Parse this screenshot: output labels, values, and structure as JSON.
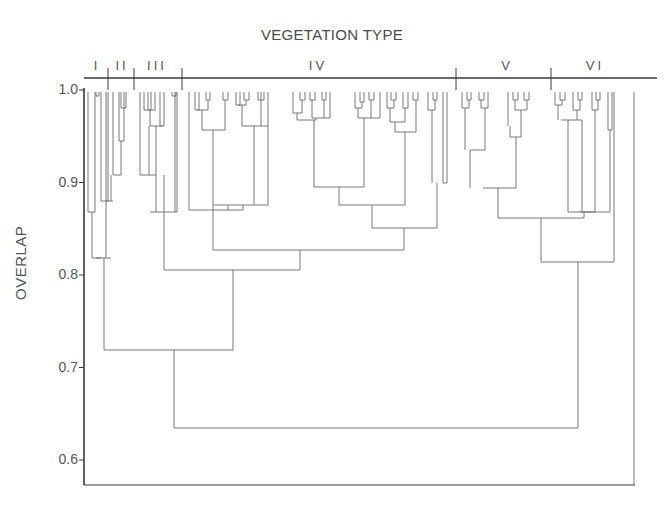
{
  "chart_data": {
    "type": "dendrogram",
    "title": "VEGETATION TYPE",
    "xlabel": "",
    "ylabel": "OVERLAP",
    "ylim": [
      0.55,
      1.0
    ],
    "yticks": [
      "1.0",
      "0.9",
      "0.8",
      "0.7",
      "0.6"
    ],
    "groups": [
      {
        "label": "I",
        "x": 97
      },
      {
        "label": "II",
        "x": 122
      },
      {
        "label": "III",
        "x": 157
      },
      {
        "label": "IV",
        "x": 318
      },
      {
        "label": "V",
        "x": 507
      },
      {
        "label": "VI",
        "x": 595
      }
    ],
    "group_boundaries_x": [
      108,
      134,
      182,
      456,
      551
    ],
    "merges": [
      {
        "groups": "I + II",
        "overlap": 0.8
      },
      {
        "groups": "I+II + III+IV",
        "overlap": 0.8
      },
      {
        "groups": "III + IV",
        "overlap": 0.91
      },
      {
        "groups": "V + VI",
        "overlap": 0.94
      },
      {
        "groups": "(I-IV) + (V-VI)",
        "overlap": 0.655
      }
    ],
    "segments": [
      [
        88,
        92,
        88,
        212
      ],
      [
        95,
        92,
        95,
        212
      ],
      [
        88,
        212,
        95,
        212
      ],
      [
        96,
        92,
        96,
        96
      ],
      [
        99,
        92,
        99,
        96
      ],
      [
        96,
        96,
        99,
        96
      ],
      [
        92,
        212,
        92,
        258
      ],
      [
        101,
        92,
        101,
        201
      ],
      [
        92,
        258,
        101,
        258
      ],
      [
        106,
        92,
        106,
        258
      ],
      [
        101,
        258,
        101,
        258
      ],
      [
        108,
        92,
        108,
        201
      ],
      [
        101,
        201,
        108,
        201
      ],
      [
        113,
        92,
        113,
        175
      ],
      [
        119,
        92,
        119,
        141
      ],
      [
        119,
        141,
        124,
        141
      ],
      [
        124,
        92,
        124,
        141
      ],
      [
        121,
        92,
        121,
        108
      ],
      [
        126,
        92,
        126,
        108
      ],
      [
        121,
        108,
        126,
        108
      ],
      [
        113,
        175,
        121,
        175
      ],
      [
        121,
        141,
        121,
        175
      ],
      [
        106,
        201,
        113,
        201
      ],
      [
        111,
        175,
        111,
        201
      ],
      [
        96,
        258,
        111,
        258
      ],
      [
        104,
        258,
        104,
        350
      ],
      [
        140,
        92,
        140,
        175
      ],
      [
        148,
        92,
        148,
        110
      ],
      [
        151,
        92,
        151,
        110
      ],
      [
        148,
        110,
        151,
        110
      ],
      [
        144,
        110,
        155,
        110
      ],
      [
        155,
        92,
        155,
        110
      ],
      [
        144,
        92,
        144,
        110
      ],
      [
        160,
        92,
        160,
        126
      ],
      [
        164,
        92,
        164,
        126
      ],
      [
        160,
        126,
        164,
        126
      ],
      [
        150,
        126,
        162,
        126
      ],
      [
        150,
        110,
        150,
        126
      ],
      [
        149,
        126,
        149,
        175
      ],
      [
        140,
        175,
        156,
        175
      ],
      [
        156,
        126,
        156,
        175
      ],
      [
        175,
        92,
        175,
        212
      ],
      [
        172,
        92,
        172,
        96
      ],
      [
        176,
        92,
        176,
        96
      ],
      [
        172,
        96,
        176,
        96
      ],
      [
        177,
        92,
        177,
        212
      ],
      [
        150,
        212,
        177,
        212
      ],
      [
        164,
        175,
        164,
        270
      ],
      [
        156,
        175,
        156,
        212
      ],
      [
        164,
        212,
        164,
        212
      ],
      [
        189,
        92,
        189,
        210
      ],
      [
        195,
        92,
        195,
        110
      ],
      [
        199,
        92,
        199,
        110
      ],
      [
        195,
        110,
        199,
        110
      ],
      [
        206,
        92,
        206,
        100
      ],
      [
        210,
        92,
        210,
        100
      ],
      [
        206,
        100,
        210,
        100
      ],
      [
        197,
        110,
        208,
        110
      ],
      [
        208,
        100,
        208,
        110
      ],
      [
        202,
        110,
        202,
        130
      ],
      [
        223,
        92,
        223,
        100
      ],
      [
        228,
        92,
        228,
        100
      ],
      [
        223,
        100,
        228,
        100
      ],
      [
        225,
        100,
        225,
        130
      ],
      [
        202,
        130,
        225,
        130
      ],
      [
        213,
        130,
        213,
        210
      ],
      [
        189,
        210,
        243,
        210
      ],
      [
        236,
        92,
        236,
        105
      ],
      [
        240,
        92,
        240,
        105
      ],
      [
        236,
        105,
        240,
        105
      ],
      [
        244,
        92,
        244,
        100
      ],
      [
        249,
        92,
        249,
        100
      ],
      [
        244,
        100,
        249,
        100
      ],
      [
        246,
        100,
        246,
        105
      ],
      [
        238,
        105,
        246,
        105
      ],
      [
        242,
        105,
        242,
        126
      ],
      [
        258,
        92,
        258,
        100
      ],
      [
        264,
        92,
        264,
        100
      ],
      [
        258,
        100,
        264,
        100
      ],
      [
        261,
        92,
        261,
        126
      ],
      [
        242,
        126,
        268,
        126
      ],
      [
        268,
        92,
        268,
        126
      ],
      [
        254,
        126,
        254,
        205
      ],
      [
        214,
        205,
        268,
        205
      ],
      [
        268,
        126,
        268,
        205
      ],
      [
        228,
        205,
        228,
        210
      ],
      [
        243,
        205,
        243,
        210
      ],
      [
        213,
        210,
        213,
        250
      ],
      [
        293,
        92,
        293,
        113
      ],
      [
        300,
        92,
        300,
        100
      ],
      [
        305,
        92,
        305,
        100
      ],
      [
        300,
        100,
        305,
        100
      ],
      [
        302,
        100,
        302,
        113
      ],
      [
        293,
        113,
        302,
        113
      ],
      [
        297,
        113,
        297,
        120
      ],
      [
        310,
        92,
        310,
        100
      ],
      [
        315,
        92,
        315,
        100
      ],
      [
        310,
        100,
        315,
        100
      ],
      [
        312,
        100,
        312,
        118
      ],
      [
        322,
        92,
        322,
        100
      ],
      [
        326,
        92,
        326,
        100
      ],
      [
        322,
        100,
        326,
        100
      ],
      [
        324,
        100,
        324,
        118
      ],
      [
        312,
        118,
        330,
        118
      ],
      [
        330,
        92,
        330,
        118
      ],
      [
        316,
        118,
        316,
        120
      ],
      [
        297,
        120,
        316,
        120
      ],
      [
        314,
        120,
        314,
        187
      ],
      [
        355,
        92,
        355,
        108
      ],
      [
        360,
        92,
        360,
        102
      ],
      [
        364,
        92,
        364,
        102
      ],
      [
        360,
        102,
        364,
        102
      ],
      [
        362,
        102,
        362,
        108
      ],
      [
        355,
        108,
        362,
        108
      ],
      [
        358,
        108,
        358,
        118
      ],
      [
        369,
        92,
        369,
        100
      ],
      [
        374,
        92,
        374,
        100
      ],
      [
        369,
        100,
        374,
        100
      ],
      [
        371,
        100,
        371,
        118
      ],
      [
        358,
        118,
        380,
        118
      ],
      [
        380,
        92,
        380,
        118
      ],
      [
        364,
        118,
        364,
        187
      ],
      [
        314,
        187,
        364,
        187
      ],
      [
        387,
        92,
        387,
        108
      ],
      [
        391,
        92,
        391,
        100
      ],
      [
        396,
        92,
        396,
        100
      ],
      [
        391,
        100,
        396,
        100
      ],
      [
        394,
        100,
        394,
        108
      ],
      [
        387,
        108,
        394,
        108
      ],
      [
        390,
        108,
        390,
        122
      ],
      [
        403,
        92,
        403,
        108
      ],
      [
        408,
        92,
        408,
        108
      ],
      [
        403,
        108,
        408,
        108
      ],
      [
        405,
        108,
        405,
        122
      ],
      [
        390,
        122,
        405,
        122
      ],
      [
        395,
        122,
        395,
        132
      ],
      [
        413,
        92,
        413,
        100
      ],
      [
        418,
        92,
        418,
        100
      ],
      [
        413,
        100,
        418,
        100
      ],
      [
        416,
        100,
        416,
        132
      ],
      [
        395,
        132,
        416,
        132
      ],
      [
        405,
        132,
        405,
        205
      ],
      [
        339,
        187,
        339,
        205
      ],
      [
        339,
        205,
        405,
        205
      ],
      [
        428,
        92,
        428,
        110
      ],
      [
        433,
        92,
        433,
        100
      ],
      [
        437,
        92,
        437,
        100
      ],
      [
        433,
        100,
        437,
        100
      ],
      [
        435,
        100,
        435,
        110
      ],
      [
        428,
        110,
        435,
        110
      ],
      [
        432,
        110,
        432,
        183
      ],
      [
        443,
        92,
        443,
        183
      ],
      [
        447,
        92,
        447,
        183
      ],
      [
        443,
        183,
        447,
        183
      ],
      [
        437,
        183,
        437,
        228
      ],
      [
        372,
        228,
        437,
        228
      ],
      [
        372,
        205,
        372,
        228
      ],
      [
        404,
        228,
        404,
        250
      ],
      [
        213,
        250,
        404,
        250
      ],
      [
        300,
        250,
        300,
        270
      ],
      [
        164,
        270,
        300,
        270
      ],
      [
        233,
        270,
        233,
        350
      ],
      [
        104,
        350,
        233,
        350
      ],
      [
        462,
        92,
        462,
        108
      ],
      [
        467,
        92,
        467,
        100
      ],
      [
        471,
        92,
        471,
        100
      ],
      [
        467,
        100,
        471,
        100
      ],
      [
        469,
        100,
        469,
        108
      ],
      [
        462,
        108,
        469,
        108
      ],
      [
        465,
        108,
        465,
        150
      ],
      [
        479,
        92,
        479,
        100
      ],
      [
        484,
        92,
        484,
        100
      ],
      [
        479,
        100,
        484,
        100
      ],
      [
        481,
        100,
        481,
        108
      ],
      [
        488,
        92,
        488,
        108
      ],
      [
        481,
        108,
        488,
        108
      ],
      [
        485,
        108,
        485,
        150
      ],
      [
        470,
        150,
        485,
        150
      ],
      [
        470,
        150,
        470,
        188
      ],
      [
        508,
        92,
        508,
        126
      ],
      [
        513,
        92,
        513,
        100
      ],
      [
        518,
        92,
        518,
        100
      ],
      [
        513,
        100,
        518,
        100
      ],
      [
        515,
        100,
        515,
        110
      ],
      [
        524,
        92,
        524,
        100
      ],
      [
        529,
        92,
        529,
        100
      ],
      [
        524,
        100,
        529,
        100
      ],
      [
        527,
        100,
        527,
        110
      ],
      [
        515,
        110,
        527,
        110
      ],
      [
        521,
        110,
        521,
        137
      ],
      [
        510,
        137,
        521,
        137
      ],
      [
        510,
        126,
        510,
        137
      ],
      [
        516,
        137,
        516,
        188
      ],
      [
        483,
        188,
        516,
        188
      ],
      [
        498,
        188,
        498,
        218
      ],
      [
        555,
        92,
        555,
        105
      ],
      [
        560,
        92,
        560,
        100
      ],
      [
        565,
        92,
        565,
        100
      ],
      [
        560,
        100,
        565,
        100
      ],
      [
        562,
        100,
        562,
        105
      ],
      [
        555,
        105,
        562,
        105
      ],
      [
        558,
        105,
        558,
        120
      ],
      [
        573,
        92,
        573,
        110
      ],
      [
        578,
        92,
        578,
        100
      ],
      [
        582,
        92,
        582,
        100
      ],
      [
        578,
        100,
        582,
        100
      ],
      [
        580,
        100,
        580,
        110
      ],
      [
        573,
        110,
        580,
        110
      ],
      [
        577,
        110,
        577,
        120
      ],
      [
        561,
        120,
        582,
        120
      ],
      [
        582,
        120,
        582,
        212
      ],
      [
        592,
        92,
        592,
        110
      ],
      [
        596,
        92,
        596,
        100
      ],
      [
        600,
        92,
        600,
        100
      ],
      [
        596,
        100,
        600,
        100
      ],
      [
        598,
        100,
        598,
        110
      ],
      [
        592,
        110,
        598,
        110
      ],
      [
        595,
        110,
        595,
        212
      ],
      [
        608,
        92,
        608,
        130
      ],
      [
        612,
        92,
        612,
        130
      ],
      [
        608,
        130,
        612,
        130
      ],
      [
        568,
        120,
        568,
        212
      ],
      [
        568,
        212,
        595,
        212
      ],
      [
        610,
        130,
        610,
        212
      ],
      [
        580,
        212,
        610,
        212
      ],
      [
        584,
        212,
        584,
        218
      ],
      [
        498,
        218,
        584,
        218
      ],
      [
        541,
        218,
        541,
        262
      ],
      [
        614,
        262,
        614,
        92
      ],
      [
        541,
        262,
        614,
        262
      ],
      [
        578,
        262,
        578,
        428
      ],
      [
        174,
        428,
        578,
        428
      ],
      [
        174,
        350,
        174,
        428
      ],
      [
        634,
        92,
        634,
        485
      ]
    ]
  }
}
